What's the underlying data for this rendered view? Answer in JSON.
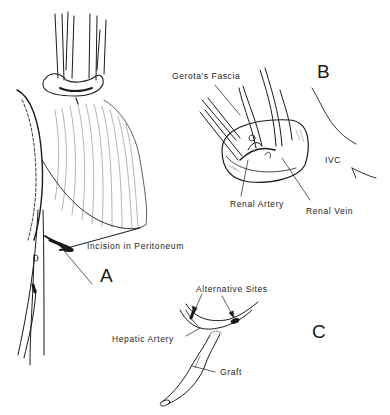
{
  "figure": {
    "panels": [
      {
        "id": "A",
        "label": "A",
        "labels": [
          "Incision in Peritoneum"
        ]
      },
      {
        "id": "B",
        "label": "B",
        "labels": [
          "Gerota's Fascia",
          "Renal Artery",
          "Renal Vein",
          "IVC"
        ]
      },
      {
        "id": "C",
        "label": "C",
        "labels": [
          "Alternative Sites",
          "Hepatic Artery",
          "Graft"
        ]
      }
    ],
    "a": {
      "panel_label": "A",
      "incision": "Incision in Peritoneum"
    },
    "b": {
      "panel_label": "B",
      "gerota": "Gerota's Fascia",
      "renal_artery": "Renal Artery",
      "renal_vein": "Renal Vein",
      "ivc": "IVC"
    },
    "c": {
      "panel_label": "C",
      "alt_sites": "Alternative Sites",
      "hepatic_artery": "Hepatic Artery",
      "graft": "Graft"
    },
    "colors": {
      "ink": "#1a1a1a",
      "background": "#ffffff"
    }
  }
}
